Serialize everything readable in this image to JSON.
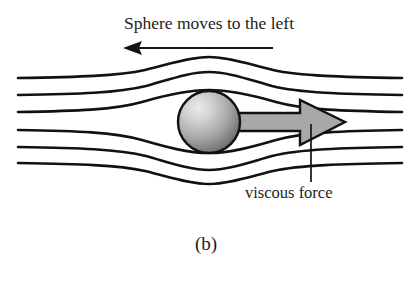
{
  "figure": {
    "caption": "(b)",
    "title_label": "Sphere moves to the left",
    "force_label": "viscous force",
    "background_color": "#ffffff",
    "ink_color": "#111111",
    "arrow_fill_color": "#a8a8a8",
    "sphere": {
      "name": "sphere",
      "center_x": 209,
      "center_y": 122,
      "radius": 31,
      "fill_light": "#e8e8e8",
      "fill_mid": "#b4b4b4",
      "fill_dark": "#6e6e6e",
      "highlight_x": 194,
      "highlight_y": 105
    },
    "motion_arrow": {
      "name": "motion-arrow",
      "direction": "left",
      "x_start": 273,
      "x_end": 123,
      "y": 48
    },
    "force_arrow": {
      "name": "viscous-force-arrow",
      "direction": "right",
      "x_start": 238,
      "x_tip": 345,
      "y": 122,
      "shaft_half_height": 9,
      "head_half_height": 23,
      "head_x": 300
    },
    "leader": {
      "name": "viscous-force-leader",
      "x": 311,
      "y_top": 124,
      "y_bottom": 182
    },
    "streamlines": {
      "count": 6,
      "left_x": 18,
      "right_x": 402,
      "inlet_y": [
        78,
        95,
        112,
        130,
        147,
        163
      ],
      "apex_offsets": [
        -13,
        -11,
        -9,
        9,
        11,
        13
      ],
      "stroke_width": 2.6
    }
  }
}
